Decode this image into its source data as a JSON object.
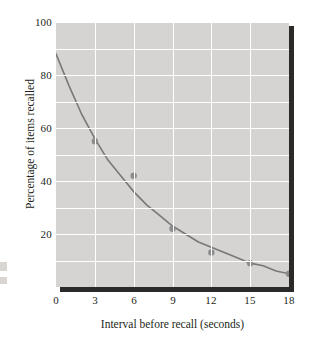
{
  "chart_data": {
    "type": "line",
    "title": "",
    "subtitle": "",
    "xlabel": "Interval before recall (seconds)",
    "ylabel": "Percentage of items recalled",
    "xlim": [
      0,
      18
    ],
    "ylim": [
      0,
      100
    ],
    "xticks": [
      0,
      3,
      6,
      9,
      12,
      15,
      18
    ],
    "xtick_labels": [
      "0",
      "3",
      "6",
      "9",
      "12",
      "15",
      "18"
    ],
    "yticks": [
      20,
      40,
      60,
      80,
      100
    ],
    "ytick_labels": [
      "20",
      "40",
      "60",
      "80",
      "100"
    ],
    "grid": true,
    "grid_x_step": 3,
    "grid_y_step": 10,
    "legend": "none",
    "annotations": [],
    "series": [
      {
        "name": "Percentage of items recalled",
        "kind": "scatter+fitted-curve",
        "marker_color": "#8c8c8c",
        "line_color": "#787878",
        "x": [
          3,
          6,
          9,
          12,
          15,
          18
        ],
        "values": [
          55,
          42,
          22,
          13,
          9,
          5
        ],
        "curve_x": [
          0,
          1,
          2,
          3,
          4,
          5,
          6,
          7,
          8,
          9,
          10,
          11,
          12,
          13,
          14,
          15,
          16,
          17,
          18
        ],
        "curve_values": [
          88,
          76,
          65,
          56,
          48,
          42,
          36,
          31,
          27,
          23,
          20,
          17,
          15,
          13,
          11,
          9,
          8,
          6,
          5
        ]
      }
    ],
    "colors": {
      "panel_background": "#d6d4d2",
      "gridline": "#ffffff",
      "shadow": "#2b2a28",
      "text": "#231f20",
      "marker": "#8c8c8c",
      "curve": "#787878",
      "page_background": "#ffffff"
    }
  }
}
